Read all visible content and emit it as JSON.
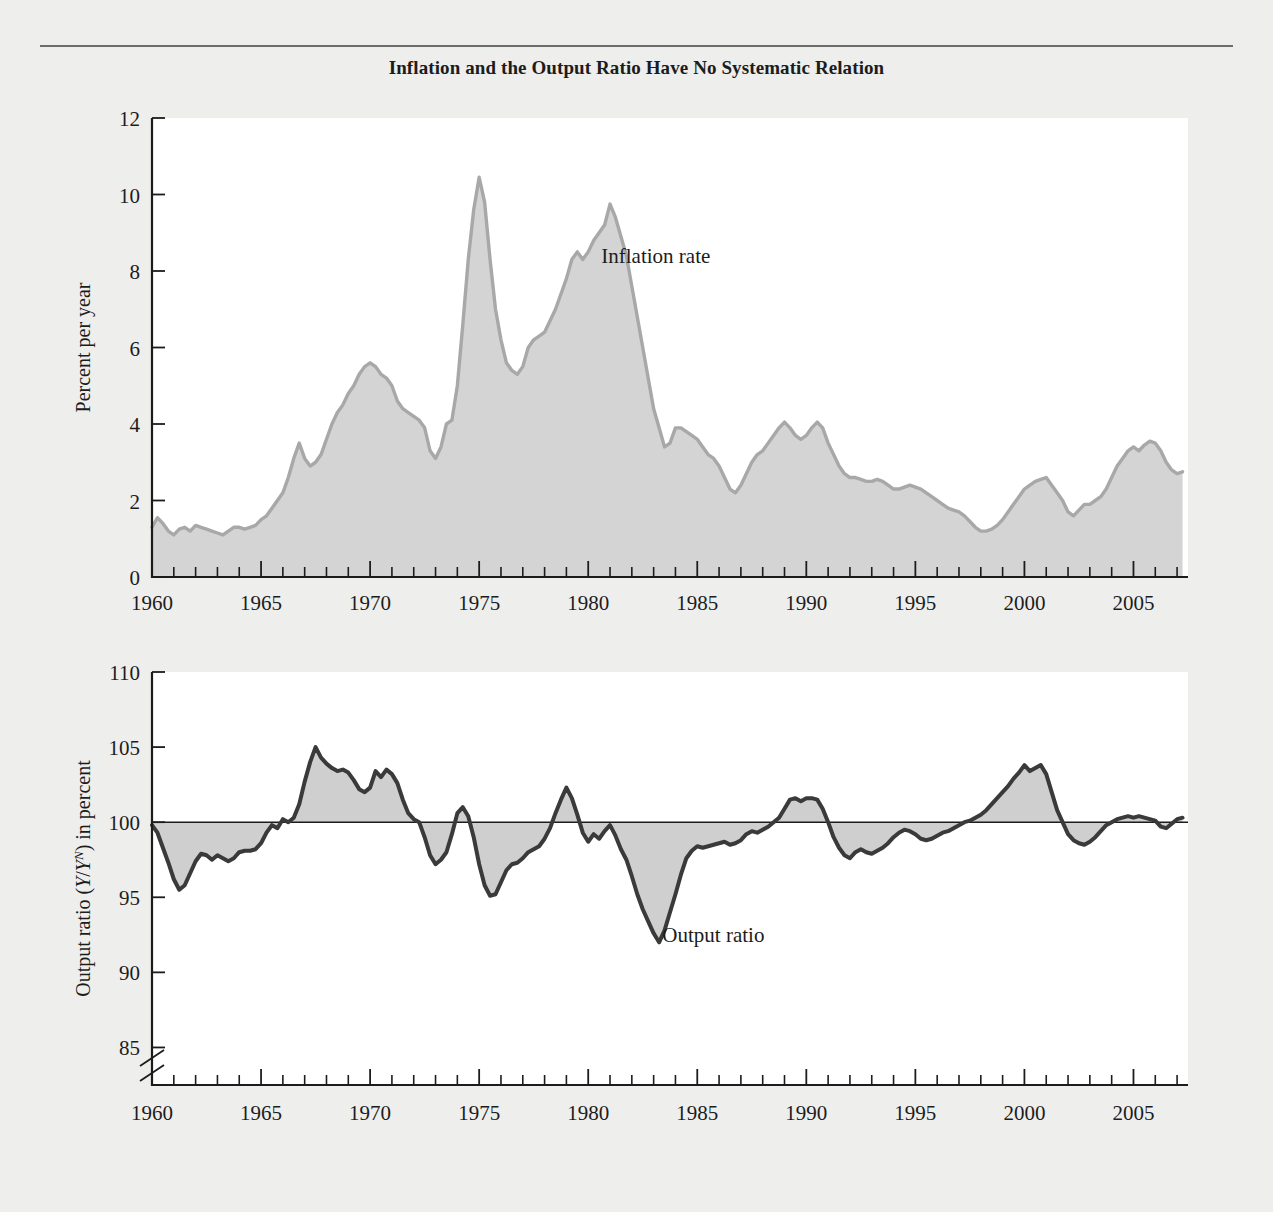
{
  "figure": {
    "title": "Inflation and the Output Ratio Have No Systematic Relation",
    "background_color": "#eeeeed",
    "panel_color": "#ffffff"
  },
  "chart_data": [
    {
      "type": "area",
      "id": "inflation-panel",
      "title": "",
      "xlabel": "",
      "ylabel": "Percent per year",
      "xlim": [
        1960,
        2007.5
      ],
      "ylim": [
        0,
        12
      ],
      "ytick_labels": [
        "0",
        "2",
        "4",
        "6",
        "8",
        "10",
        "12"
      ],
      "yticks": [
        0,
        2,
        4,
        6,
        8,
        10,
        12
      ],
      "xtick_labels": [
        "1960",
        "1965",
        "1970",
        "1975",
        "1980",
        "1985",
        "1990",
        "1995",
        "2000",
        "2005"
      ],
      "xticks": [
        1960,
        1965,
        1970,
        1975,
        1980,
        1985,
        1990,
        1995,
        2000,
        2005
      ],
      "minor_xtick_interval": 1,
      "grid": false,
      "legend": "none",
      "annotations": [
        {
          "text": "Inflation rate",
          "x": 1980.6,
          "y": 8.2,
          "name": "inflation-rate-label"
        }
      ],
      "line_color": "#a8a8a8",
      "fill_color": "#d4d4d4",
      "series": [
        {
          "name": "Inflation rate",
          "x": [
            1960.0,
            1960.25,
            1960.5,
            1960.75,
            1961.0,
            1961.25,
            1961.5,
            1961.75,
            1962.0,
            1962.25,
            1962.5,
            1962.75,
            1963.0,
            1963.25,
            1963.5,
            1963.75,
            1964.0,
            1964.25,
            1964.5,
            1964.75,
            1965.0,
            1965.25,
            1965.5,
            1965.75,
            1966.0,
            1966.25,
            1966.5,
            1966.75,
            1967.0,
            1967.25,
            1967.5,
            1967.75,
            1968.0,
            1968.25,
            1968.5,
            1968.75,
            1969.0,
            1969.25,
            1969.5,
            1969.75,
            1970.0,
            1970.25,
            1970.5,
            1970.75,
            1971.0,
            1971.25,
            1971.5,
            1971.75,
            1972.0,
            1972.25,
            1972.5,
            1972.75,
            1973.0,
            1973.25,
            1973.5,
            1973.75,
            1974.0,
            1974.25,
            1974.5,
            1974.75,
            1975.0,
            1975.25,
            1975.5,
            1975.75,
            1976.0,
            1976.25,
            1976.5,
            1976.75,
            1977.0,
            1977.25,
            1977.5,
            1977.75,
            1978.0,
            1978.25,
            1978.5,
            1978.75,
            1979.0,
            1979.25,
            1979.5,
            1979.75,
            1980.0,
            1980.25,
            1980.5,
            1980.75,
            1981.0,
            1981.25,
            1981.5,
            1981.75,
            1982.0,
            1982.25,
            1982.5,
            1982.75,
            1983.0,
            1983.25,
            1983.5,
            1983.75,
            1984.0,
            1984.25,
            1984.5,
            1984.75,
            1985.0,
            1985.25,
            1985.5,
            1985.75,
            1986.0,
            1986.25,
            1986.5,
            1986.75,
            1987.0,
            1987.25,
            1987.5,
            1987.75,
            1988.0,
            1988.25,
            1988.5,
            1988.75,
            1989.0,
            1989.25,
            1989.5,
            1989.75,
            1990.0,
            1990.25,
            1990.5,
            1990.75,
            1991.0,
            1991.25,
            1991.5,
            1991.75,
            1992.0,
            1992.25,
            1992.5,
            1992.75,
            1993.0,
            1993.25,
            1993.5,
            1993.75,
            1994.0,
            1994.25,
            1994.5,
            1994.75,
            1995.0,
            1995.25,
            1995.5,
            1995.75,
            1996.0,
            1996.25,
            1996.5,
            1996.75,
            1997.0,
            1997.25,
            1997.5,
            1997.75,
            1998.0,
            1998.25,
            1998.5,
            1998.75,
            1999.0,
            1999.25,
            1999.5,
            1999.75,
            2000.0,
            2000.25,
            2000.5,
            2000.75,
            2001.0,
            2001.25,
            2001.5,
            2001.75,
            2002.0,
            2002.25,
            2002.5,
            2002.75,
            2003.0,
            2003.25,
            2003.5,
            2003.75,
            2004.0,
            2004.25,
            2004.5,
            2004.75,
            2005.0,
            2005.25,
            2005.5,
            2005.75,
            2006.0,
            2006.25,
            2006.5,
            2006.75,
            2007.0,
            2007.25
          ],
          "values": [
            1.3,
            1.55,
            1.4,
            1.2,
            1.1,
            1.25,
            1.3,
            1.2,
            1.35,
            1.3,
            1.25,
            1.2,
            1.15,
            1.1,
            1.2,
            1.3,
            1.3,
            1.25,
            1.3,
            1.35,
            1.5,
            1.6,
            1.8,
            2.0,
            2.2,
            2.6,
            3.1,
            3.5,
            3.1,
            2.9,
            3.0,
            3.2,
            3.6,
            4.0,
            4.3,
            4.5,
            4.8,
            5.0,
            5.3,
            5.5,
            5.6,
            5.5,
            5.3,
            5.2,
            5.0,
            4.6,
            4.4,
            4.3,
            4.2,
            4.1,
            3.9,
            3.3,
            3.1,
            3.4,
            4.0,
            4.1,
            5.0,
            6.6,
            8.3,
            9.6,
            10.45,
            9.8,
            8.3,
            7.0,
            6.2,
            5.6,
            5.4,
            5.3,
            5.5,
            6.0,
            6.2,
            6.3,
            6.4,
            6.7,
            7.0,
            7.4,
            7.8,
            8.3,
            8.5,
            8.3,
            8.5,
            8.8,
            9.0,
            9.2,
            9.75,
            9.4,
            8.9,
            8.4,
            7.6,
            6.8,
            6.0,
            5.2,
            4.4,
            3.9,
            3.4,
            3.5,
            3.9,
            3.9,
            3.8,
            3.7,
            3.6,
            3.4,
            3.2,
            3.1,
            2.9,
            2.6,
            2.3,
            2.2,
            2.4,
            2.7,
            3.0,
            3.2,
            3.3,
            3.5,
            3.7,
            3.9,
            4.05,
            3.9,
            3.7,
            3.6,
            3.7,
            3.9,
            4.05,
            3.9,
            3.5,
            3.2,
            2.9,
            2.7,
            2.6,
            2.6,
            2.55,
            2.5,
            2.5,
            2.55,
            2.5,
            2.4,
            2.3,
            2.3,
            2.35,
            2.4,
            2.35,
            2.3,
            2.2,
            2.1,
            2.0,
            1.9,
            1.8,
            1.75,
            1.7,
            1.6,
            1.45,
            1.3,
            1.2,
            1.2,
            1.25,
            1.35,
            1.5,
            1.7,
            1.9,
            2.1,
            2.3,
            2.4,
            2.5,
            2.55,
            2.6,
            2.4,
            2.2,
            2.0,
            1.7,
            1.6,
            1.75,
            1.9,
            1.9,
            2.0,
            2.1,
            2.3,
            2.6,
            2.9,
            3.1,
            3.3,
            3.4,
            3.3,
            3.45,
            3.55,
            3.5,
            3.3,
            3.0,
            2.8,
            2.7,
            2.75
          ]
        }
      ]
    },
    {
      "type": "area",
      "id": "output-ratio-panel",
      "title": "",
      "xlabel": "",
      "ylabel": "Output ratio (Y/Y N) in percent",
      "ylabel_parts": {
        "prefix": "Output ratio (",
        "italic1": "Y",
        "slash": "/",
        "italic2": "Y",
        "sup": "N",
        "suffix": ") in percent"
      },
      "xlim": [
        1960,
        2007.5
      ],
      "ylim": [
        82.5,
        110
      ],
      "ytick_labels": [
        "85",
        "90",
        "95",
        "100",
        "105",
        "110"
      ],
      "yticks": [
        85,
        90,
        95,
        100,
        105,
        110
      ],
      "axis_break_below": 85,
      "xtick_labels": [
        "1960",
        "1965",
        "1970",
        "1975",
        "1980",
        "1985",
        "1990",
        "1995",
        "2000",
        "2005"
      ],
      "xticks": [
        1960,
        1965,
        1970,
        1975,
        1980,
        1985,
        1990,
        1995,
        2000,
        2005
      ],
      "minor_xtick_interval": 1,
      "reference_line": 100,
      "grid": false,
      "legend": "none",
      "annotations": [
        {
          "text": "Output ratio",
          "x": 1983.4,
          "y": 92.0,
          "name": "output-ratio-label"
        }
      ],
      "line_color": "#3a3a3a",
      "fill_color": "#cfcfcf",
      "series": [
        {
          "name": "Output ratio",
          "x": [
            1960.0,
            1960.25,
            1960.5,
            1960.75,
            1961.0,
            1961.25,
            1961.5,
            1961.75,
            1962.0,
            1962.25,
            1962.5,
            1962.75,
            1963.0,
            1963.25,
            1963.5,
            1963.75,
            1964.0,
            1964.25,
            1964.5,
            1964.75,
            1965.0,
            1965.25,
            1965.5,
            1965.75,
            1966.0,
            1966.25,
            1966.5,
            1966.75,
            1967.0,
            1967.25,
            1967.5,
            1967.75,
            1968.0,
            1968.25,
            1968.5,
            1968.75,
            1969.0,
            1969.25,
            1969.5,
            1969.75,
            1970.0,
            1970.25,
            1970.5,
            1970.75,
            1971.0,
            1971.25,
            1971.5,
            1971.75,
            1972.0,
            1972.25,
            1972.5,
            1972.75,
            1973.0,
            1973.25,
            1973.5,
            1973.75,
            1974.0,
            1974.25,
            1974.5,
            1974.75,
            1975.0,
            1975.25,
            1975.5,
            1975.75,
            1976.0,
            1976.25,
            1976.5,
            1976.75,
            1977.0,
            1977.25,
            1977.5,
            1977.75,
            1978.0,
            1978.25,
            1978.5,
            1978.75,
            1979.0,
            1979.25,
            1979.5,
            1979.75,
            1980.0,
            1980.25,
            1980.5,
            1980.75,
            1981.0,
            1981.25,
            1981.5,
            1981.75,
            1982.0,
            1982.25,
            1982.5,
            1982.75,
            1983.0,
            1983.25,
            1983.5,
            1983.75,
            1984.0,
            1984.25,
            1984.5,
            1984.75,
            1985.0,
            1985.25,
            1985.5,
            1985.75,
            1986.0,
            1986.25,
            1986.5,
            1986.75,
            1987.0,
            1987.25,
            1987.5,
            1987.75,
            1988.0,
            1988.25,
            1988.5,
            1988.75,
            1989.0,
            1989.25,
            1989.5,
            1989.75,
            1990.0,
            1990.25,
            1990.5,
            1990.75,
            1991.0,
            1991.25,
            1991.5,
            1991.75,
            1992.0,
            1992.25,
            1992.5,
            1992.75,
            1993.0,
            1993.25,
            1993.5,
            1993.75,
            1994.0,
            1994.25,
            1994.5,
            1994.75,
            1995.0,
            1995.25,
            1995.5,
            1995.75,
            1996.0,
            1996.25,
            1996.5,
            1996.75,
            1997.0,
            1997.25,
            1997.5,
            1997.75,
            1998.0,
            1998.25,
            1998.5,
            1998.75,
            1999.0,
            1999.25,
            1999.5,
            1999.75,
            2000.0,
            2000.25,
            2000.5,
            2000.75,
            2001.0,
            2001.25,
            2001.5,
            2001.75,
            2002.0,
            2002.25,
            2002.5,
            2002.75,
            2003.0,
            2003.25,
            2003.5,
            2003.75,
            2004.0,
            2004.25,
            2004.5,
            2004.75,
            2005.0,
            2005.25,
            2005.5,
            2005.75,
            2006.0,
            2006.25,
            2006.5,
            2006.75,
            2007.0,
            2007.25
          ],
          "values": [
            99.8,
            99.3,
            98.3,
            97.3,
            96.2,
            95.5,
            95.8,
            96.6,
            97.4,
            97.9,
            97.8,
            97.5,
            97.8,
            97.6,
            97.4,
            97.6,
            98.0,
            98.1,
            98.1,
            98.2,
            98.6,
            99.3,
            99.8,
            99.6,
            100.2,
            100.0,
            100.3,
            101.2,
            102.7,
            104.0,
            105.0,
            104.3,
            103.9,
            103.6,
            103.4,
            103.5,
            103.3,
            102.8,
            102.2,
            102.0,
            102.3,
            103.4,
            103.0,
            103.5,
            103.2,
            102.6,
            101.5,
            100.6,
            100.2,
            100.0,
            99.0,
            97.8,
            97.2,
            97.5,
            98.0,
            99.2,
            100.6,
            101.0,
            100.4,
            99.0,
            97.2,
            95.8,
            95.1,
            95.2,
            96.0,
            96.8,
            97.2,
            97.3,
            97.6,
            98.0,
            98.2,
            98.4,
            98.9,
            99.6,
            100.6,
            101.5,
            102.3,
            101.6,
            100.5,
            99.3,
            98.7,
            99.2,
            98.9,
            99.4,
            99.8,
            99.1,
            98.2,
            97.5,
            96.4,
            95.2,
            94.2,
            93.4,
            92.6,
            92.0,
            92.8,
            94.0,
            95.2,
            96.5,
            97.6,
            98.1,
            98.4,
            98.3,
            98.4,
            98.5,
            98.6,
            98.7,
            98.5,
            98.6,
            98.8,
            99.2,
            99.4,
            99.3,
            99.5,
            99.7,
            100.0,
            100.3,
            100.9,
            101.5,
            101.6,
            101.4,
            101.6,
            101.6,
            101.5,
            100.9,
            100.0,
            99.0,
            98.3,
            97.8,
            97.6,
            98.0,
            98.2,
            98.0,
            97.9,
            98.1,
            98.3,
            98.6,
            99.0,
            99.3,
            99.5,
            99.4,
            99.2,
            98.9,
            98.8,
            98.9,
            99.1,
            99.3,
            99.4,
            99.6,
            99.8,
            100.0,
            100.1,
            100.3,
            100.5,
            100.8,
            101.2,
            101.6,
            102.0,
            102.4,
            102.9,
            103.3,
            103.8,
            103.4,
            103.6,
            103.8,
            103.2,
            102.0,
            100.8,
            100.0,
            99.2,
            98.8,
            98.6,
            98.5,
            98.7,
            99.0,
            99.4,
            99.8,
            100.0,
            100.2,
            100.3,
            100.4,
            100.3,
            100.4,
            100.3,
            100.2,
            100.1,
            99.7,
            99.6,
            99.9,
            100.2,
            100.3
          ]
        }
      ]
    }
  ]
}
